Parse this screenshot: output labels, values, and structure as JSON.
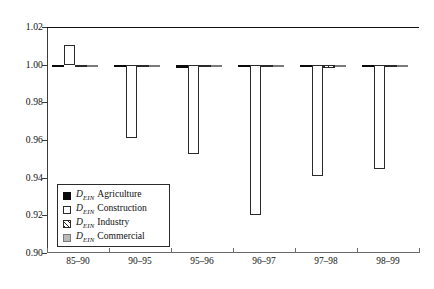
{
  "chart_data": {
    "type": "bar",
    "title": "",
    "xlabel": "",
    "ylabel": "",
    "ylim": [
      0.9,
      1.02
    ],
    "yticks": [
      "1.02",
      "1.00",
      "0.98",
      "0.96",
      "0.94",
      "0.92",
      "0.90"
    ],
    "ytick_values": [
      1.02,
      1.0,
      0.98,
      0.96,
      0.94,
      0.92,
      0.9
    ],
    "grid": false,
    "legend_position": "lower-left-inside",
    "baseline": 1.0,
    "categories": [
      "85–90",
      "90–95",
      "95–96",
      "96–97",
      "97–98",
      "98–99"
    ],
    "series": [
      {
        "name": "Agriculture",
        "symbol": "D",
        "subscript": "EIN",
        "fill": "black",
        "color": "#0a0a0a",
        "values": [
          0.9998,
          0.9988,
          0.9983,
          0.9997,
          0.9996,
          0.9997
        ]
      },
      {
        "name": "Construction",
        "symbol": "D",
        "subscript": "EIN",
        "fill": "white",
        "color": "#ffffff",
        "values": [
          1.0104,
          0.9612,
          0.9525,
          0.9203,
          0.9408,
          0.9447
        ]
      },
      {
        "name": "Industry",
        "symbol": "D",
        "subscript": "EIN",
        "fill": "hatched",
        "color": "#2a2a2a",
        "values": [
          0.9999,
          0.9994,
          0.9999,
          0.9999,
          0.9983,
          0.9998
        ]
      },
      {
        "name": "Commercial",
        "symbol": "D",
        "subscript": "EIN",
        "fill": "gray",
        "color": "#b9b9b9",
        "values": [
          0.9997,
          0.9995,
          0.9995,
          0.9991,
          0.9993,
          0.9995
        ]
      }
    ]
  },
  "legend": {
    "items": [
      {
        "symbol": "D",
        "subscript": "EIN",
        "label": "Agriculture"
      },
      {
        "symbol": "D",
        "subscript": "EIN",
        "label": "Construction"
      },
      {
        "symbol": "D",
        "subscript": "EIN",
        "label": "Industry"
      },
      {
        "symbol": "D",
        "subscript": "EIN",
        "label": "Commercial"
      }
    ]
  }
}
